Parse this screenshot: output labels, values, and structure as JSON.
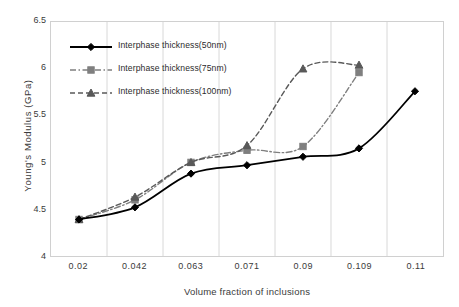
{
  "chart_data": {
    "type": "line",
    "title": "",
    "subtitle": "",
    "xlabel": "Volume fraction of inclusions",
    "ylabel": "Young's Modulus (GPa)",
    "categories": [
      "0.02",
      "0.042",
      "0.063",
      "0.071",
      "0.09",
      "0.109",
      "0.11"
    ],
    "x": [
      0.02,
      0.042,
      0.063,
      0.071,
      0.09,
      0.109,
      0.11
    ],
    "ylim": [
      4,
      6.5
    ],
    "yticks": [
      "6.5",
      "6",
      "5.5",
      "5",
      "4.5",
      "4"
    ],
    "ytick_values": [
      6.5,
      6,
      5.5,
      5,
      4.5,
      4
    ],
    "grid": "vertical-only",
    "legend_position": "top-left-inside",
    "series": [
      {
        "name": "Interphase thickness(50nm)",
        "marker": "diamond",
        "linestyle": "solid",
        "color": "#000000",
        "values": [
          4.39,
          4.52,
          4.88,
          4.97,
          5.06,
          5.15,
          5.76
        ]
      },
      {
        "name": "Interphase thickness(75nm)",
        "marker": "square",
        "linestyle": "dash-dot",
        "color": "#7f7f7f",
        "values": [
          4.39,
          4.6,
          5.0,
          5.13,
          5.17,
          5.96,
          null
        ]
      },
      {
        "name": "Interphase thickness(100nm)",
        "marker": "triangle",
        "linestyle": "dashed",
        "color": "#595959",
        "values": [
          4.39,
          4.63,
          5.0,
          5.18,
          6.0,
          6.04,
          null
        ]
      }
    ]
  },
  "axis": {
    "y_title": "Young's Modulus (GPa)",
    "x_title": "Volume fraction of inclusions"
  },
  "legend": {
    "items": [
      {
        "label": "Interphase thickness(50nm)"
      },
      {
        "label": "Interphase thickness(75nm)"
      },
      {
        "label": "Interphase thickness(100nm)"
      }
    ]
  },
  "colors": {
    "series_50nm": "#000000",
    "series_75nm": "#7f7f7f",
    "series_100nm": "#595959",
    "grid": "#d8d8d8",
    "frame": "#d0d0d0",
    "text": "#3a3a3a"
  }
}
